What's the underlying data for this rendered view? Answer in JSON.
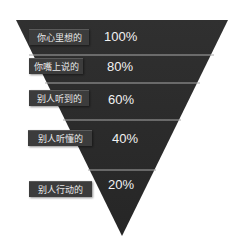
{
  "diagram": {
    "type": "inverted-funnel",
    "colors": {
      "fill": "#2e2e2e",
      "divider": "#a8a8a8",
      "label_bg": "#3c3c3c",
      "text": "#f2f2f2",
      "background": "#ffffff"
    },
    "levels": [
      {
        "label": "你心里想的",
        "percent": "100%"
      },
      {
        "label": "你嘴上说的",
        "percent": "80%"
      },
      {
        "label": "别人听到的",
        "percent": "60%"
      },
      {
        "label": "别人听懂的",
        "percent": "40%"
      },
      {
        "label": "别人行动的",
        "percent": "20%"
      }
    ]
  }
}
